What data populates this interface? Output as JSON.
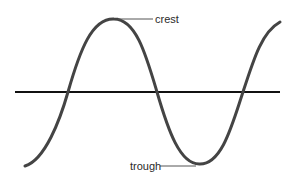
{
  "diagram": {
    "type": "wave",
    "labels": {
      "crest": "crest",
      "trough": "trough"
    },
    "colors": {
      "wave": "#444444",
      "axis": "#111111",
      "leader": "#555555",
      "text": "#2a2a2a"
    }
  }
}
